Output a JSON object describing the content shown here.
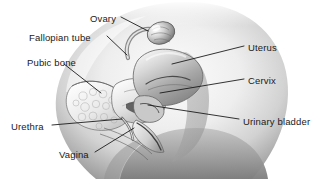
{
  "figure": {
    "view": "sagittal midline section of the female pelvis",
    "style": "grayscale airbrushed medical illustration",
    "background_color": "#ffffff",
    "leader_line_color": "#111111",
    "label_text_color": "#1a1a1a"
  },
  "labels": [
    {
      "id": "ovary",
      "text": "Ovary",
      "side": "left",
      "text_x": 90,
      "text_y": 14,
      "leader": {
        "x1": 121,
        "y1": 17,
        "x2": 148,
        "y2": 31
      }
    },
    {
      "id": "fallopian-tube",
      "text": "Fallopian tube",
      "side": "left",
      "text_x": 29,
      "text_y": 33,
      "leader": {
        "x1": 107,
        "y1": 36,
        "x2": 127,
        "y2": 55
      }
    },
    {
      "id": "pubic-bone",
      "text": "Pubic bone",
      "side": "left",
      "text_x": 27,
      "text_y": 58,
      "leader": {
        "x1": 64,
        "y1": 64,
        "x2": 101,
        "y2": 93
      }
    },
    {
      "id": "urethra",
      "text": "Urethra",
      "side": "left",
      "text_x": 11,
      "text_y": 122,
      "leader": {
        "x1": 52,
        "y1": 125,
        "x2": 122,
        "y2": 119
      }
    },
    {
      "id": "vagina",
      "text": "Vagina",
      "side": "left",
      "text_x": 59,
      "text_y": 150,
      "leader": {
        "x1": 95,
        "y1": 152,
        "x2": 134,
        "y2": 128
      }
    },
    {
      "id": "uterus",
      "text": "Uterus",
      "side": "right",
      "text_x": 248,
      "text_y": 43,
      "leader": {
        "x1": 244,
        "y1": 46,
        "x2": 172,
        "y2": 64
      }
    },
    {
      "id": "cervix",
      "text": "Cervix",
      "side": "right",
      "text_x": 248,
      "text_y": 76,
      "leader": {
        "x1": 244,
        "y1": 79,
        "x2": 160,
        "y2": 93
      }
    },
    {
      "id": "urinary-bladder",
      "text": "Urinary bladder",
      "side": "right",
      "text_x": 243,
      "text_y": 117,
      "leader": {
        "x1": 239,
        "y1": 119,
        "x2": 148,
        "y2": 105
      }
    }
  ]
}
